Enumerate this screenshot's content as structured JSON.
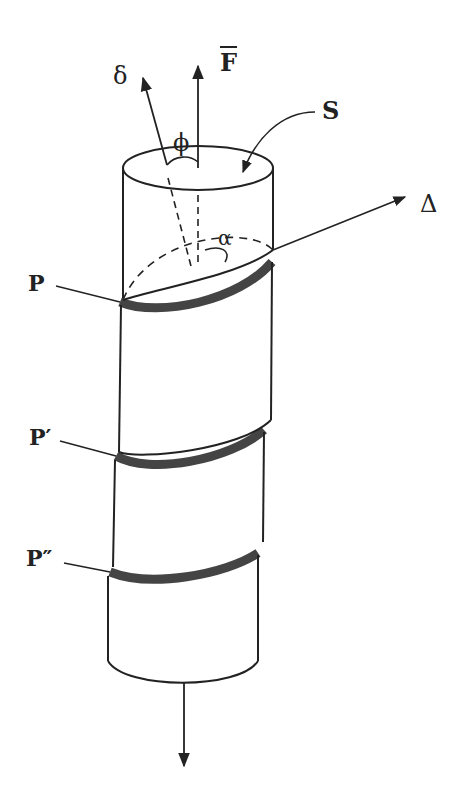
{
  "figure": {
    "labels": {
      "force": "F",
      "slip_direction": "δ",
      "normal": "Δ",
      "angle_phi": "ϕ",
      "angle_alpha": "α",
      "area": "S",
      "plane_1": "P",
      "plane_2": "P′",
      "plane_3": "P″"
    },
    "colors": {
      "line": "#222222",
      "band": "#444444",
      "background": "#ffffff"
    }
  }
}
